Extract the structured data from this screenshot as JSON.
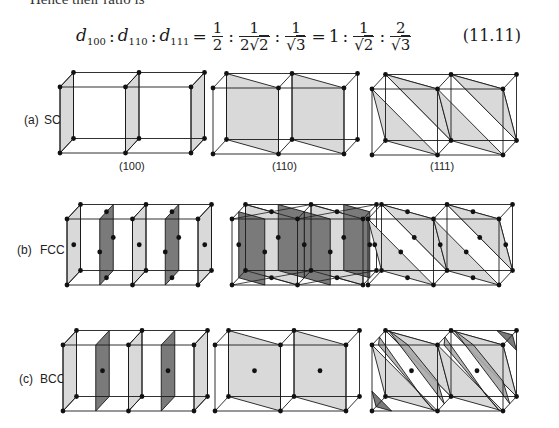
{
  "lead_text": "Hence their ratio is",
  "equation": {
    "lhs": [
      {
        "var": "d",
        "sub": "100"
      },
      {
        "var": "d",
        "sub": "110"
      },
      {
        "var": "d",
        "sub": "111"
      }
    ],
    "mid": [
      {
        "num": "1",
        "den": "2",
        "root": ""
      },
      {
        "num": "1",
        "den": "2",
        "root": "2"
      },
      {
        "num": "1",
        "den": "",
        "root": "3"
      }
    ],
    "rhs_first": "1",
    "rhs": [
      {
        "num": "1",
        "den": "",
        "root": "2"
      },
      {
        "num": "2",
        "den": "",
        "root": "3"
      }
    ],
    "number": "(11.11)"
  },
  "figure": {
    "rows": [
      {
        "tag": "(a)",
        "lattice": "SC",
        "col_labels": [
          "(100)",
          "(110)",
          "(111)"
        ]
      },
      {
        "tag": "(b)",
        "lattice": "FCC",
        "col_labels": []
      },
      {
        "tag": "(c)",
        "lattice": "BCC",
        "col_labels": []
      }
    ],
    "planes": [
      "100",
      "110",
      "111"
    ],
    "colors": {
      "edge": "#1a1a1a",
      "light_fill": "#d9d9d9",
      "dark_fill": "#7a7a7a",
      "medium_fill": "#a8a8a8",
      "atom": "#111111"
    }
  }
}
